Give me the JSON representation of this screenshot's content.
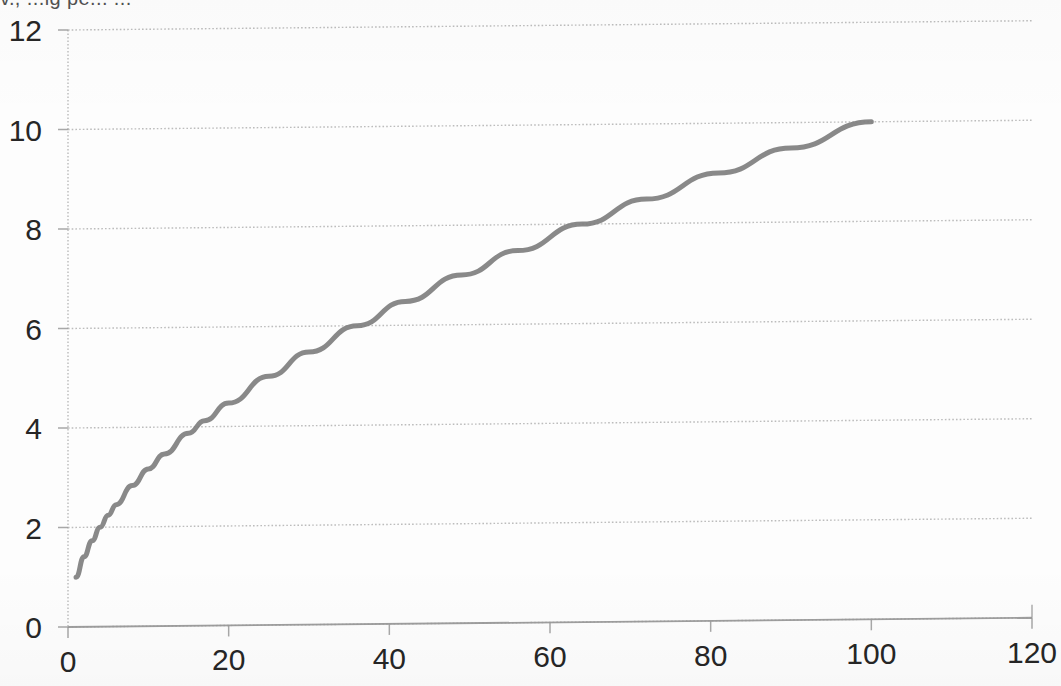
{
  "page": {
    "clipped_header_text": "v., ...ig pe...  ..."
  },
  "chart_data": {
    "type": "line",
    "title": "",
    "subtitle": "",
    "xlabel": "",
    "ylabel": "",
    "xlim": [
      0,
      120
    ],
    "ylim": [
      0,
      12
    ],
    "xticks": [
      0,
      20,
      40,
      60,
      80,
      100,
      120
    ],
    "yticks": [
      0,
      2,
      4,
      6,
      8,
      10,
      12
    ],
    "xtick_labels": [
      "0",
      "20",
      "40",
      "60",
      "80",
      "100",
      "120"
    ],
    "ytick_labels": [
      "0",
      "2",
      "4",
      "6",
      "8",
      "10",
      "12"
    ],
    "grid": {
      "horizontal": true,
      "vertical": false,
      "style": "dotted",
      "color": "#b9b9b9"
    },
    "legend": {
      "visible": false,
      "position": "none",
      "entries": []
    },
    "annotations": [],
    "series": [
      {
        "name": "y = sqrt(x)",
        "color": "#7f7f7f",
        "line_width": 5,
        "markers": false,
        "x": [
          1,
          2,
          3,
          4,
          5,
          6,
          8,
          10,
          12,
          15,
          17,
          20,
          25,
          30,
          36,
          42,
          49,
          56,
          64,
          72,
          81,
          90,
          100
        ],
        "y": [
          1,
          1.41,
          1.73,
          2,
          2.24,
          2.45,
          2.83,
          3.16,
          3.46,
          3.87,
          4.12,
          4.47,
          5,
          5.48,
          6,
          6.48,
          7,
          7.48,
          8,
          8.49,
          9,
          9.49,
          10
        ]
      }
    ],
    "key_readings": [
      {
        "x": 1,
        "y": 1
      },
      {
        "x": 4.8,
        "y": 2
      },
      {
        "x": 16.9,
        "y": 4
      },
      {
        "x": 36.4,
        "y": 6
      },
      {
        "x": 64.3,
        "y": 8
      },
      {
        "x": 100,
        "y": 10
      }
    ]
  },
  "axis_geometry": {
    "plot_left_px": 68,
    "plot_right_px": 1032,
    "plot_top_px": 30,
    "plot_bottom_px": 627,
    "skew_deg": -0.55
  }
}
